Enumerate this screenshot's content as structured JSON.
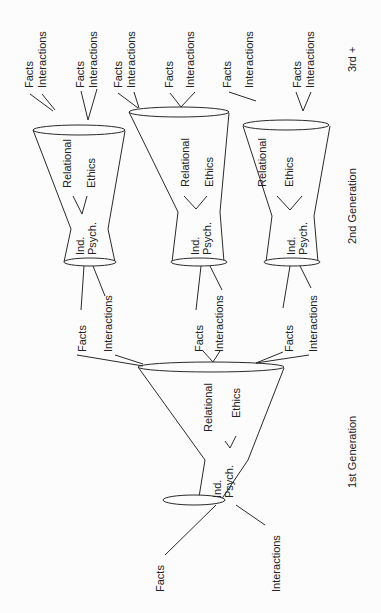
{
  "diagram": {
    "generation_labels": {
      "first": "1st Generation",
      "second": "2nd Generation",
      "third": "3rd +"
    },
    "funnel_labels": {
      "relational": "Relational",
      "ethics": "Ethics",
      "ind": "Ind.",
      "psych": "Psych."
    },
    "input_labels": {
      "facts": "Facts",
      "interactions": "Interactions"
    },
    "gen1": {
      "inputs_bottom": [
        "Facts",
        "Interactions"
      ],
      "funnel": {
        "relational": "Relational",
        "ethics": "Ethics",
        "ind": "Ind.",
        "psych": "Psych."
      }
    },
    "gen2": [
      {
        "facts": "Facts",
        "interactions": "Interactions",
        "top_facts": "Facts",
        "top_interactions": "Interactions"
      },
      {
        "facts": "Facts",
        "interactions": "Interactions",
        "top_facts_a": "Facts",
        "top_interactions_a": "Interactions",
        "top_facts_b": "Facts",
        "top_interactions_b": "Interactions"
      },
      {
        "facts": "Facts",
        "interactions": "Interactions",
        "top_facts_a": "Facts",
        "top_interactions_a": "Interactions",
        "top_facts_b": "Facts",
        "top_interactions_b": "Interactions"
      }
    ],
    "gen3_inputs": [
      {
        "facts": "Facts",
        "interactions": "Interactions"
      },
      {
        "facts": "Facts",
        "interactions": "Interactions"
      },
      {
        "facts": "Facts",
        "interactions": "Interactions"
      },
      {
        "facts": "Facts",
        "interactions": "Interactions"
      },
      {
        "facts": "Facts",
        "interactions": "Interactions"
      }
    ]
  }
}
